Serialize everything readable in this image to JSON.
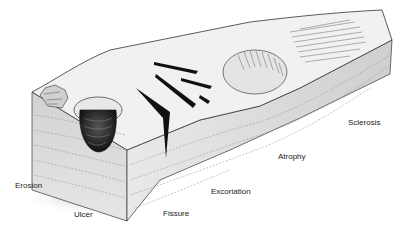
{
  "diagram": {
    "colors": {
      "top_surface": "#f1f1f1",
      "front_face": "#d9d9d9",
      "side_face": "#e4e4e4",
      "outline": "#333333",
      "lesion_dark": "#1a1a1a",
      "label_text": "#222222"
    },
    "labels": [
      {
        "id": "erosion",
        "text": "Erosion",
        "x": 15,
        "y": 182
      },
      {
        "id": "ulcer",
        "text": "Ulcer",
        "x": 74,
        "y": 211
      },
      {
        "id": "fissure",
        "text": "Fissure",
        "x": 163,
        "y": 210
      },
      {
        "id": "excoriation",
        "text": "Excoriation",
        "x": 211,
        "y": 188
      },
      {
        "id": "atrophy",
        "text": "Atrophy",
        "x": 278,
        "y": 153
      },
      {
        "id": "sclerosis",
        "text": "Sclerosis",
        "x": 348,
        "y": 119
      }
    ]
  }
}
